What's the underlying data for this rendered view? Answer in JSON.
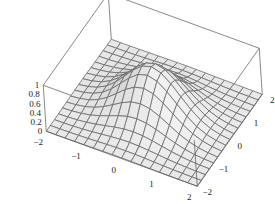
{
  "chart_data": {
    "type": "surface3d",
    "title": "",
    "function": "exp(-(x^2 + y^2))",
    "x_range": [
      -2,
      2
    ],
    "y_range": [
      -2,
      2
    ],
    "z_range": [
      0,
      1
    ],
    "mesh_divisions": 16,
    "x_ticks": [
      "-2",
      "-1",
      "0",
      "1",
      "2"
    ],
    "y_ticks": [
      "-2",
      "-1",
      "0",
      "1",
      "2"
    ],
    "z_ticks": [
      "0",
      "0.2",
      "0.4",
      "0.6",
      "0.8",
      "1"
    ],
    "boxed": true,
    "xlabel": "",
    "ylabel": "",
    "zlabel": ""
  },
  "projection": {
    "origin": [
      154.25,
      112.75
    ],
    "ex": [
      37.75,
      13.75
    ],
    "ey": [
      16.25,
      -23.0
    ],
    "ez": [
      -3.0,
      -46.0
    ]
  },
  "colors": {
    "surface_light": "#f2f2f2",
    "surface_dark": "#b9b9b9",
    "mesh_line": "#6a6a6a",
    "box_line": "#555555",
    "background": "#ffffff"
  }
}
